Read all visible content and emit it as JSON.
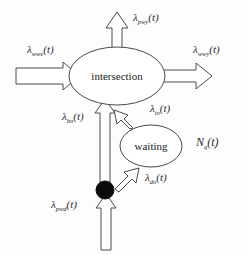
{
  "diagram": {
    "background_color": "#fdfdfd",
    "stroke_color": "#4a4a4a",
    "nodes": [
      {
        "id": "intersection",
        "label": "intersection",
        "shape": "ellipse"
      },
      {
        "id": "waiting",
        "label": "waiting",
        "shape": "ellipse"
      },
      {
        "id": "junction",
        "label": "",
        "shape": "filled-circle",
        "color": "#0b0b0b"
      }
    ],
    "labels": {
      "top_outflow": {
        "symbol": "λ",
        "subscript": "pwy",
        "arg": "(t)"
      },
      "left_inflow": {
        "symbol": "λ",
        "subscript": "wwe",
        "arg": "(t)"
      },
      "right_outflow": {
        "symbol": "λ",
        "subscript": "wwy",
        "arg": "(t)"
      },
      "bottom_left_vertical": {
        "symbol": "λ",
        "subscript": "bo",
        "arg": "(t)"
      },
      "waiting_to_intersection": {
        "symbol": "λ",
        "subscript": "to",
        "arg": "(t)"
      },
      "junction_to_waiting": {
        "symbol": "λ",
        "subscript": "do",
        "arg": "(t)"
      },
      "bottom_inflow": {
        "symbol": "λ",
        "subscript": "pwd",
        "arg": "(t)"
      },
      "queue_count": {
        "symbol": "N",
        "subscript": "q",
        "arg": "(t)"
      }
    }
  }
}
